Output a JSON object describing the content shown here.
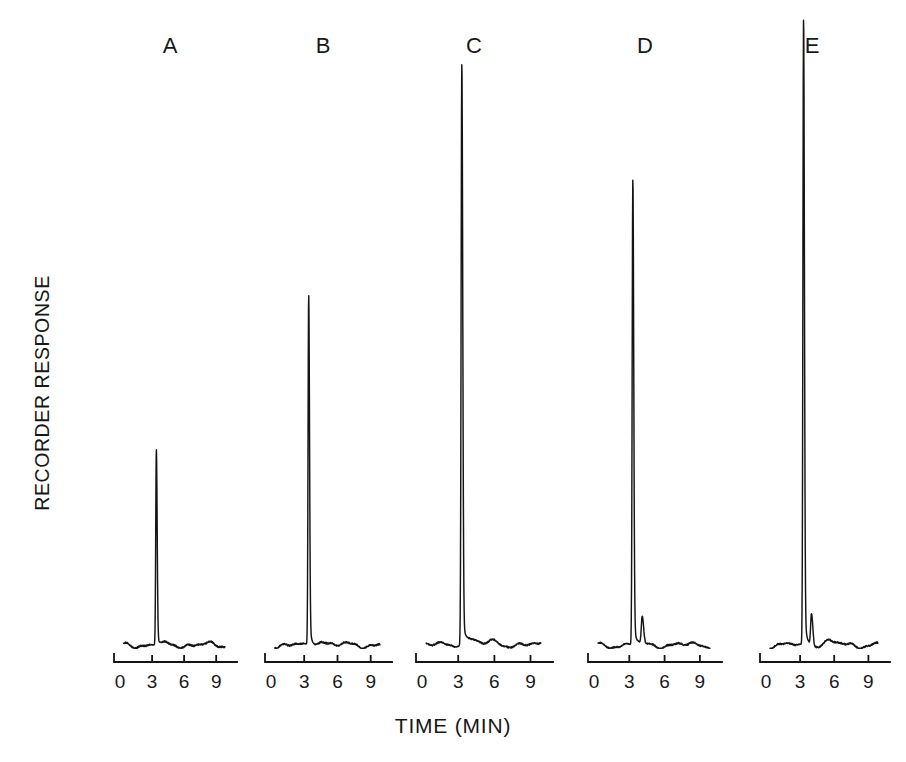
{
  "figure": {
    "y_axis_label": "RECORDER RESPONSE",
    "x_axis_label": "TIME (MIN)"
  },
  "panels": [
    {
      "id": "A",
      "label": "A",
      "label_x": 170,
      "label_y": 33,
      "axis_x0": 114,
      "axis_x1": 237,
      "baseline_y": 645,
      "axis_y": 662,
      "peak_time": 3.4,
      "peak_apex_y": 450,
      "tick_labels": [
        "0",
        "3",
        "6",
        "9"
      ]
    },
    {
      "id": "B",
      "label": "B",
      "label_x": 323,
      "label_y": 33,
      "axis_x0": 265,
      "axis_x1": 392,
      "baseline_y": 645,
      "axis_y": 662,
      "peak_time": 3.4,
      "peak_apex_y": 297,
      "tick_labels": [
        "0",
        "3",
        "6",
        "9"
      ]
    },
    {
      "id": "C",
      "label": "C",
      "label_x": 474,
      "label_y": 33,
      "axis_x0": 416,
      "axis_x1": 553,
      "baseline_y": 645,
      "axis_y": 662,
      "peak_time": 3.3,
      "peak_apex_y": 65,
      "tick_labels": [
        "0",
        "3",
        "6",
        "9"
      ]
    },
    {
      "id": "D",
      "label": "D",
      "label_x": 645,
      "label_y": 33,
      "axis_x0": 588,
      "axis_x1": 722,
      "baseline_y": 645,
      "axis_y": 662,
      "peak_time": 3.3,
      "peak_apex_y": 180,
      "second_peak_time": 4.1,
      "second_peak_height": 26,
      "tick_labels": [
        "0",
        "3",
        "6",
        "9"
      ]
    },
    {
      "id": "E",
      "label": "E",
      "label_x": 812,
      "label_y": 33,
      "axis_x0": 760,
      "axis_x1": 890,
      "baseline_y": 645,
      "axis_y": 662,
      "peak_time": 3.3,
      "peak_apex_y": 20,
      "second_peak_time": 4.0,
      "second_peak_height": 32,
      "tick_labels": [
        "0",
        "3",
        "6",
        "9"
      ]
    }
  ],
  "chart_data": {
    "type": "line",
    "title": "",
    "xlabel": "TIME (MIN)",
    "ylabel": "RECORDER RESPONSE",
    "xlim": [
      0,
      11
    ],
    "xticks": [
      0,
      3,
      6,
      9
    ],
    "grid": false,
    "legend": "none",
    "annotations": [
      "A",
      "B",
      "C",
      "D",
      "E"
    ],
    "series": [
      {
        "name": "A",
        "peak_retention_min": 3.4,
        "relative_peak_height": 0.32,
        "secondary_peak_retention_min": null,
        "secondary_relative_height": 0.0
      },
      {
        "name": "B",
        "peak_retention_min": 3.4,
        "relative_peak_height": 0.56,
        "secondary_peak_retention_min": null,
        "secondary_relative_height": 0.0
      },
      {
        "name": "C",
        "peak_retention_min": 3.3,
        "relative_peak_height": 0.93,
        "secondary_peak_retention_min": null,
        "secondary_relative_height": 0.0
      },
      {
        "name": "D",
        "peak_retention_min": 3.3,
        "relative_peak_height": 0.74,
        "secondary_peak_retention_min": 4.1,
        "secondary_relative_height": 0.042
      },
      {
        "name": "E",
        "peak_retention_min": 3.3,
        "relative_peak_height": 1.0,
        "secondary_peak_retention_min": 4.0,
        "secondary_relative_height": 0.051
      }
    ]
  }
}
